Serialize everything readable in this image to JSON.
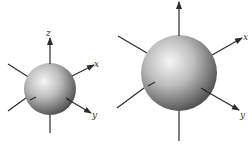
{
  "figure": {
    "colors": {
      "axis": "#2a2a2a",
      "sphere_light": "#f4f4f4",
      "sphere_mid": "#b0b0b0",
      "sphere_dark": "#4a4a4a",
      "label": "#333333"
    },
    "panels": [
      {
        "name": "small-sphere",
        "axis_labels": {
          "z": "z",
          "x": "x",
          "y": "y"
        }
      },
      {
        "name": "large-sphere",
        "axis_labels": {
          "z": "",
          "x": "x",
          "y": "y"
        }
      }
    ]
  }
}
